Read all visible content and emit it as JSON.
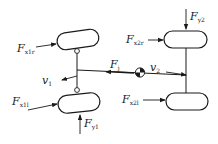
{
  "diagram": {
    "colors": {
      "line": "#1a1a1a",
      "background": "#ffffff"
    },
    "labels": {
      "fx1r": {
        "main": "F",
        "sub": "x1r"
      },
      "fx1l": {
        "main": "F",
        "sub": "x1l"
      },
      "fy1": {
        "main": "F",
        "sub": "y1"
      },
      "fx2r": {
        "main": "F",
        "sub": "x2r"
      },
      "fx2l": {
        "main": "F",
        "sub": "x2l"
      },
      "fy2": {
        "main": "F",
        "sub": "y2"
      },
      "fj": {
        "main": "F",
        "sub": "j"
      },
      "v1": {
        "main": "v",
        "sub": "1"
      },
      "v2": {
        "main": "v",
        "sub": "2"
      }
    },
    "elements": [
      "front-right-wheel",
      "front-left-wheel",
      "rear-right-wheel",
      "rear-left-wheel",
      "front-axle",
      "rear-axle",
      "body-line",
      "center-of-mass"
    ]
  }
}
